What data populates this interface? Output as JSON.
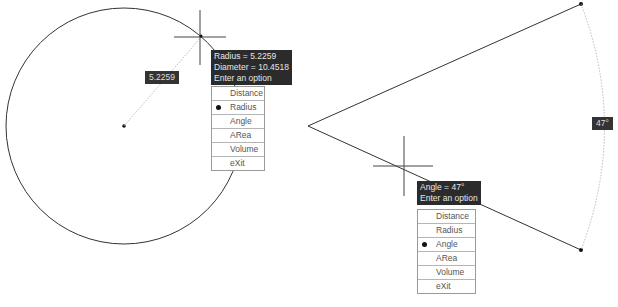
{
  "left_panel": {
    "dimension_label": "5.2259",
    "tooltip": {
      "lines": [
        "Radius = 5.2259",
        "Diameter = 10.4518",
        "Enter an option"
      ]
    },
    "menu": {
      "items": [
        {
          "label": "Distance",
          "selected": false
        },
        {
          "label": "Radius",
          "selected": true
        },
        {
          "label": "Angle",
          "selected": false
        },
        {
          "label": "ARea",
          "selected": false
        },
        {
          "label": "Volume",
          "selected": false
        },
        {
          "label": "eXit",
          "selected": false
        }
      ]
    }
  },
  "right_panel": {
    "dimension_label": "47°",
    "tooltip": {
      "lines": [
        "Angle = 47°",
        "Enter an option"
      ]
    },
    "menu": {
      "items": [
        {
          "label": "Distance",
          "selected": false
        },
        {
          "label": "Radius",
          "selected": false
        },
        {
          "label": "Angle",
          "selected": true
        },
        {
          "label": "ARea",
          "selected": false
        },
        {
          "label": "Volume",
          "selected": false
        },
        {
          "label": "eXit",
          "selected": false
        }
      ]
    }
  },
  "colors": {
    "geometry": "#333333",
    "tooltip_bg": "#2b2b2b",
    "tooltip_text": "#e6e6e6",
    "menu_border": "#9a9a9a"
  }
}
